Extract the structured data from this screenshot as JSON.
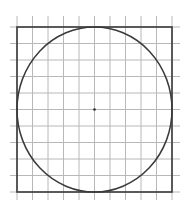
{
  "diagram": {
    "type": "circle-inscribed-in-square-on-grid",
    "canvas": {
      "width": 188,
      "height": 212
    },
    "colors": {
      "background": "#ffffff",
      "grid": "#b8b8b8",
      "frame": "#3a3a3a",
      "circle": "#3a3a3a",
      "center_dot": "#2a2a2a"
    },
    "grid": {
      "columns": 10,
      "rows": 10,
      "x_lines": [
        17,
        32.5,
        48,
        63.5,
        79,
        94.5,
        110,
        125.5,
        141,
        156.5,
        172
      ],
      "y_lines": [
        27,
        43.5,
        60,
        76.5,
        93,
        109.5,
        126,
        142.5,
        159,
        175.5,
        192
      ],
      "extend_x": [
        10,
        180
      ],
      "extend_y": [
        16,
        200
      ]
    },
    "square": {
      "x": 17,
      "y": 27,
      "width": 155,
      "height": 165
    },
    "circle": {
      "cx": 94.5,
      "cy": 109.5,
      "rx": 77.5,
      "ry": 82.5
    },
    "center_point": {
      "x": 94.5,
      "y": 109.5,
      "r": 1.3
    }
  }
}
